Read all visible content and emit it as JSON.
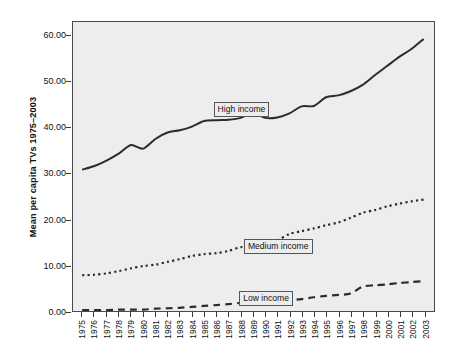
{
  "chart_data": {
    "type": "line",
    "title": "",
    "subtitle": "",
    "xlabel": "",
    "ylabel": "Mean per capita TVs 1975–2003",
    "ylim": [
      0.0,
      63.0
    ],
    "yticks": [
      "0.00",
      "10.00",
      "20.00",
      "30.00",
      "40.00",
      "50.00",
      "60.00"
    ],
    "ytick_values": [
      0,
      10,
      20,
      30,
      40,
      50,
      60
    ],
    "grid": false,
    "legend_position": "inline-annotations",
    "x": [
      "1975",
      "1976",
      "1977",
      "1978",
      "1979",
      "1980",
      "1981",
      "1982",
      "1983",
      "1984",
      "1985",
      "1986",
      "1987",
      "1988",
      "1989",
      "1990",
      "1991",
      "1992",
      "1993",
      "1994",
      "1995",
      "1996",
      "1997",
      "1998",
      "1999",
      "2000",
      "2001",
      "2002",
      "2003"
    ],
    "categories": [
      "1975",
      "1976",
      "1977",
      "1978",
      "1979",
      "1980",
      "1981",
      "1982",
      "1983",
      "1984",
      "1985",
      "1986",
      "1987",
      "1988",
      "1989",
      "1990",
      "1991",
      "1992",
      "1993",
      "1994",
      "1995",
      "1996",
      "1997",
      "1998",
      "1999",
      "2000",
      "2001",
      "2002",
      "2003"
    ],
    "series": [
      {
        "name": "High income",
        "style": "solid",
        "color": "#2b2b2b",
        "values": [
          30.8,
          31.6,
          32.8,
          34.3,
          36.2,
          35.4,
          37.5,
          38.9,
          39.4,
          40.2,
          41.4,
          41.6,
          41.7,
          42.1,
          43.2,
          42.1,
          42.2,
          43.1,
          44.6,
          44.7,
          46.6,
          47.0,
          47.9,
          49.3,
          51.4,
          53.4,
          55.4,
          57.1,
          59.3
        ]
      },
      {
        "name": "Medium income",
        "style": "dotted",
        "color": "#2b2b2b",
        "values": [
          7.8,
          7.9,
          8.2,
          8.7,
          9.3,
          9.8,
          10.1,
          10.7,
          11.3,
          12.0,
          12.4,
          12.6,
          13.1,
          13.9,
          14.1,
          14.6,
          15.4,
          16.8,
          17.4,
          18.0,
          18.7,
          19.3,
          20.3,
          21.4,
          22.0,
          22.8,
          23.4,
          23.9,
          24.3
        ]
      },
      {
        "name": "Low income",
        "style": "dashed",
        "color": "#2b2b2b",
        "values": [
          0.2,
          0.2,
          0.2,
          0.3,
          0.3,
          0.3,
          0.5,
          0.6,
          0.7,
          0.9,
          1.1,
          1.3,
          1.5,
          1.8,
          2.0,
          2.2,
          2.1,
          2.3,
          2.6,
          3.0,
          3.3,
          3.5,
          3.8,
          5.3,
          5.6,
          5.8,
          6.1,
          6.3,
          6.5
        ]
      }
    ],
    "annotations": [
      {
        "text": "High income",
        "x": "1988",
        "y": 44.0
      },
      {
        "text": "Medium income",
        "x": "1991",
        "y": 14.4
      },
      {
        "text": "Low income",
        "x": "1990",
        "y": 3.1
      }
    ]
  },
  "style": {
    "plot_background": "#ededed",
    "page_background": "#ffffff",
    "frame_color": "#4a4a4a",
    "line_color": "#2b2b2b",
    "text_color": "#111111"
  }
}
